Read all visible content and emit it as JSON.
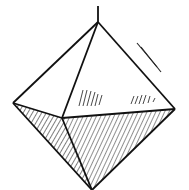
{
  "figure": {
    "stroke_color": "#111111",
    "background": "#ffffff",
    "vertices": {
      "top": [
        98,
        22
      ],
      "left": [
        13,
        103
      ],
      "front": [
        62,
        118
      ],
      "right": [
        175,
        109
      ],
      "bottom": [
        92,
        190
      ],
      "stem_top": [
        98,
        6
      ]
    },
    "faces": [
      {
        "name": "upper-left",
        "shaded": false
      },
      {
        "name": "upper-front",
        "shaded": true,
        "hatch": "sparse"
      },
      {
        "name": "lower-left",
        "shaded": true,
        "hatch": "dense"
      },
      {
        "name": "lower-front",
        "shaded": true,
        "hatch": "dense"
      }
    ],
    "annotation_marks": "parallel lines near upper-right edge"
  }
}
